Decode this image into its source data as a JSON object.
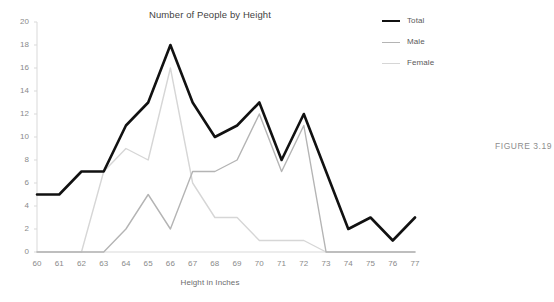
{
  "chart_data": {
    "type": "line",
    "title": "Number of People by Height",
    "xlabel": "Height in Inches",
    "ylabel": "",
    "grid": false,
    "legend_position": "top-right",
    "xlim": [
      60,
      77
    ],
    "ylim": [
      0,
      20
    ],
    "y_ticks": [
      0,
      2,
      4,
      6,
      8,
      10,
      12,
      14,
      16,
      18,
      20
    ],
    "x_ticks": [
      60,
      61,
      62,
      63,
      64,
      65,
      66,
      67,
      68,
      69,
      70,
      71,
      72,
      73,
      74,
      75,
      76,
      77
    ],
    "categories": [
      "60",
      "61",
      "62",
      "63",
      "64",
      "65",
      "66",
      "67",
      "68",
      "69",
      "70",
      "71",
      "72",
      "73",
      "74",
      "75",
      "76",
      "77"
    ],
    "series": [
      {
        "name": "Total",
        "color": "#111111",
        "width": 2.6,
        "values": [
          5,
          5,
          7,
          7,
          11,
          13,
          18,
          13,
          10,
          11,
          13,
          8,
          12,
          7,
          2,
          3,
          1,
          3
        ]
      },
      {
        "name": "Male",
        "color": "#b4b4b4",
        "width": 1.4,
        "values": [
          0,
          0,
          0,
          0,
          2,
          5,
          2,
          7,
          7,
          8,
          12,
          7,
          11,
          0,
          0,
          0,
          0,
          0
        ]
      },
      {
        "name": "Female",
        "color": "#d6d6d6",
        "width": 1.4,
        "values": [
          0,
          0,
          0,
          7,
          9,
          8,
          16,
          6,
          3,
          3,
          1,
          1,
          1,
          0,
          0,
          0,
          0,
          0
        ]
      }
    ]
  },
  "legend": {
    "items": [
      {
        "label": "Total"
      },
      {
        "label": "Male"
      },
      {
        "label": "Female"
      }
    ]
  },
  "caption": {
    "text": "FIGURE 3.19"
  },
  "colors": {
    "total": "#111111",
    "male": "#b4b4b4",
    "female": "#d6d6d6",
    "axis": "#d9d9d9",
    "tick_text": "#8a8a8a",
    "title_text": "#3f3f3f",
    "caption_text": "#8d8d8d"
  }
}
